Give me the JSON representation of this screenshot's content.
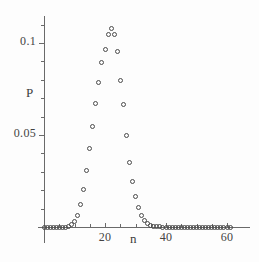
{
  "chart_data": {
    "type": "scatter",
    "title": "",
    "subtitle": "",
    "xlabel": "n",
    "ylabel": "P",
    "xlim": [
      0,
      63
    ],
    "ylim": [
      0,
      0.118
    ],
    "grid": false,
    "legend": "none",
    "marker_style": "open-circle",
    "x_ticks_major": [
      20,
      40,
      60
    ],
    "x_tick_labels": [
      "20",
      "40",
      "60"
    ],
    "x_ticks_minor": [
      5,
      10,
      15,
      25,
      30,
      35,
      45,
      50,
      55
    ],
    "y_ticks_major": [
      0.05,
      0.1
    ],
    "y_tick_labels": [
      "0.05",
      "0.1"
    ],
    "y_ticks_minor": [
      0.01,
      0.02,
      0.03,
      0.04,
      0.06,
      0.07,
      0.08,
      0.09,
      0.11
    ],
    "x": [
      0,
      1,
      2,
      3,
      4,
      5,
      6,
      7,
      8,
      9,
      10,
      11,
      12,
      13,
      14,
      15,
      16,
      17,
      18,
      19,
      20,
      21,
      22,
      23,
      24,
      25,
      26,
      27,
      28,
      29,
      30,
      31,
      32,
      33,
      34,
      35,
      36,
      37,
      38,
      39,
      40,
      41,
      42,
      43,
      44,
      45,
      46,
      47,
      48,
      49,
      50,
      51,
      52,
      53,
      54,
      55,
      56,
      57,
      58,
      59,
      60,
      61
    ],
    "values": [
      0.0,
      0.0,
      0.0,
      0.0,
      0.0,
      0.0,
      0.0,
      0.0,
      0.0005,
      0.0012,
      0.003,
      0.0065,
      0.0123,
      0.0203,
      0.0307,
      0.0425,
      0.0545,
      0.0672,
      0.0785,
      0.0895,
      0.0965,
      0.1045,
      0.108,
      0.1045,
      0.0955,
      0.0795,
      0.0665,
      0.0495,
      0.0352,
      0.0245,
      0.0165,
      0.0105,
      0.0062,
      0.0035,
      0.0018,
      0.0009,
      0.0004,
      0.0002,
      0.0001,
      0.0,
      0.0,
      0.0,
      0.0,
      0.0,
      0.0,
      0.0,
      0.0,
      0.0,
      0.0,
      0.0,
      0.0,
      0.0,
      0.0,
      0.0,
      0.0,
      0.0,
      0.0,
      0.0,
      0.0,
      0.0,
      0.0,
      0.0
    ],
    "peak": {
      "n": 18,
      "P": 0.108
    }
  },
  "axes": {
    "y_label": "P",
    "x_label": "n"
  },
  "geometry": {
    "x_origin_px": 44,
    "x_px_per_unit": 3.05,
    "y_zero_px": 227,
    "y_px_per_unit": 1840
  }
}
